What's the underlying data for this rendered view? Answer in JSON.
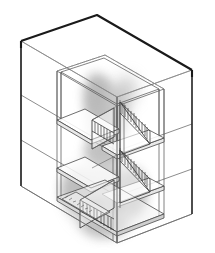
{
  "figure": {
    "kind": "axonometric-line-drawing",
    "title": "",
    "caption": "",
    "labels": [],
    "annotations": [],
    "canvas": {
      "width": 215,
      "height": 253,
      "background": "#ffffff"
    },
    "ink": {
      "outline_dark": "#1a1a1a",
      "line_medium": "#4a4a4a",
      "line_thin": "#6e6e6e",
      "line_faint": "#9a9a9a",
      "smudge": "#8a8a8a"
    },
    "projection": {
      "type": "axonometric",
      "apex_back_top": [
        97,
        15
      ],
      "corner_left_top": [
        21,
        41
      ],
      "corner_right_top": [
        192,
        70
      ],
      "corner_front_top": [
        117,
        97
      ],
      "corner_left_bottom": [
        21,
        186
      ],
      "corner_right_bottom": [
        192,
        214
      ],
      "corner_front_bottom": [
        117,
        243
      ]
    },
    "structure": {
      "stories": 3,
      "floor_lines_left_y": [
        95,
        140
      ],
      "floor_lines_right_y": [
        124,
        169
      ],
      "stair_flights": 4,
      "treads_per_flight": 11,
      "landings": 5
    }
  }
}
